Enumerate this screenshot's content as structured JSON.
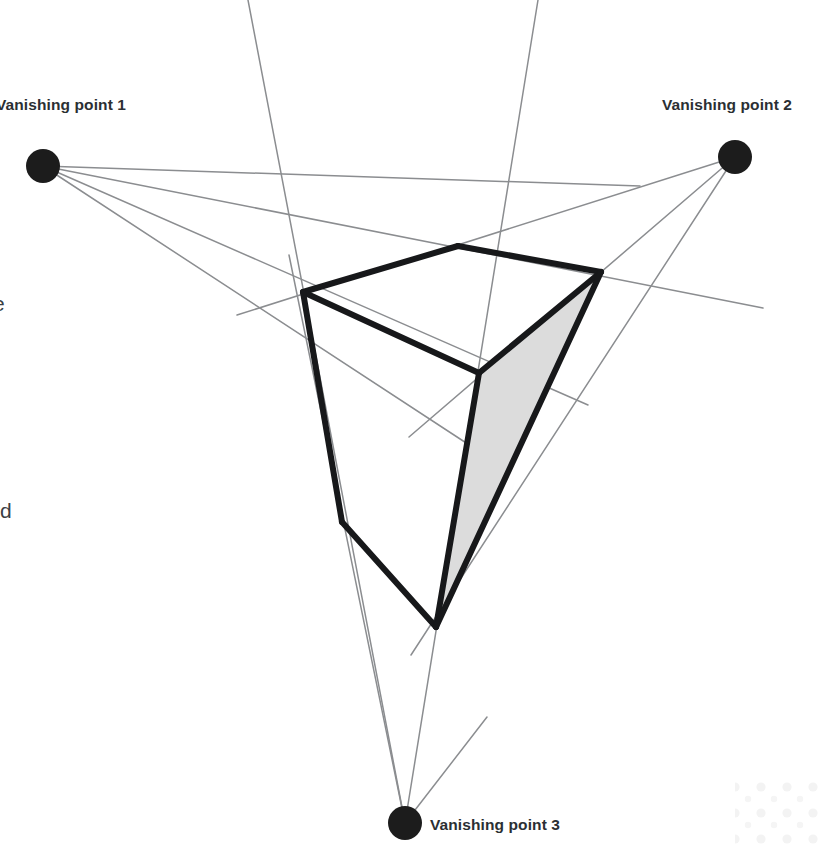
{
  "figure": {
    "type": "three-point-perspective-diagram",
    "width": 820,
    "height": 846,
    "background_color": "#ffffff"
  },
  "labels": {
    "vp1": "Vanishing point 1",
    "vp2": "Vanishing point 2",
    "vp3": "Vanishing point 3"
  },
  "clipped_text": {
    "fragment_1": "e",
    "fragment_2": "rd"
  },
  "colors": {
    "guide_line": "#8b8d90",
    "cube_edge": "#17181a",
    "vanishing_dot": "#1c1c1c",
    "shaded_face": "#dcdcdc",
    "shaded_face_stroke": "#cfcfcf",
    "label_text": "#2b2f33",
    "decor_dots": "#f4f4f4"
  },
  "geometry": {
    "vanishing_points": [
      {
        "name": "vp1",
        "cx": 43,
        "cy": 166,
        "r": 17
      },
      {
        "name": "vp2",
        "cx": 735,
        "cy": 157,
        "r": 17
      },
      {
        "name": "vp3",
        "cx": 405,
        "cy": 823,
        "r": 17
      }
    ],
    "cube_vertices": {
      "top_back": [
        458,
        246
      ],
      "top_left": [
        303,
        292
      ],
      "top_right": [
        601,
        272
      ],
      "top_front": [
        479,
        373
      ],
      "bottom_left": [
        342,
        522
      ],
      "bottom_front": [
        436,
        627
      ]
    },
    "cube_edges": [
      {
        "name": "top-back-to-top-left",
        "from": [
          458,
          246
        ],
        "to": [
          303,
          292
        ]
      },
      {
        "name": "top-back-to-top-right",
        "from": [
          458,
          246
        ],
        "to": [
          601,
          272
        ]
      },
      {
        "name": "top-left-to-top-front",
        "from": [
          303,
          292
        ],
        "to": [
          479,
          373
        ]
      },
      {
        "name": "top-right-to-top-front",
        "from": [
          601,
          272
        ],
        "to": [
          479,
          373
        ]
      },
      {
        "name": "top-left-to-bottom-left",
        "from": [
          303,
          292
        ],
        "to": [
          342,
          522
        ]
      },
      {
        "name": "bottom-left-to-bottom-front",
        "from": [
          342,
          522
        ],
        "to": [
          436,
          627
        ]
      },
      {
        "name": "top-front-to-bottom-front",
        "from": [
          479,
          373
        ],
        "to": [
          436,
          627
        ]
      },
      {
        "name": "top-right-to-bottom-front",
        "from": [
          601,
          272
        ],
        "to": [
          436,
          627
        ]
      }
    ],
    "shaded_face": {
      "name": "right-face",
      "points": [
        [
          601,
          272
        ],
        [
          479,
          373
        ],
        [
          436,
          627
        ]
      ]
    },
    "guide_lines": [
      {
        "name": "vp1-to-top-left-extended",
        "from": [
          43,
          166
        ],
        "to": [
          763,
          308
        ]
      },
      {
        "name": "vp1-to-bottom-left",
        "from": [
          43,
          166
        ],
        "to": [
          480,
          452
        ]
      },
      {
        "name": "vp1-to-bottom-front",
        "from": [
          43,
          166
        ],
        "to": [
          588,
          405
        ]
      },
      {
        "name": "vp1-to-lower-right",
        "from": [
          43,
          166
        ],
        "to": [
          640,
          186
        ]
      },
      {
        "name": "vp2-to-top-right-extended",
        "from": [
          735,
          157
        ],
        "to": [
          237,
          315
        ]
      },
      {
        "name": "vp2-to-top-front",
        "from": [
          735,
          157
        ],
        "to": [
          409,
          437
        ]
      },
      {
        "name": "vp2-to-bottom-front",
        "from": [
          735,
          157
        ],
        "to": [
          411,
          655
        ]
      },
      {
        "name": "vp3-left-vertical",
        "from": [
          405,
          823
        ],
        "to": [
          248,
          0
        ]
      },
      {
        "name": "vp3-right-vertical",
        "from": [
          405,
          823
        ],
        "to": [
          538,
          0
        ]
      },
      {
        "name": "vp3-to-bottom-left-extended",
        "from": [
          405,
          823
        ],
        "to": [
          289,
          255
        ]
      },
      {
        "name": "vp3-to-bottom-front-extended",
        "from": [
          405,
          823
        ],
        "to": [
          487,
          717
        ]
      }
    ]
  },
  "decor": {
    "dot_cluster_corner": "bottom-right"
  }
}
